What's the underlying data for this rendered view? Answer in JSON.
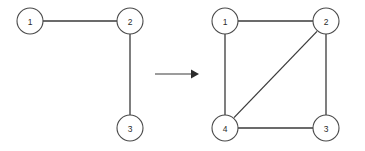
{
  "figure": {
    "background_color": "#ffffff",
    "width": 365,
    "height": 151
  },
  "style": {
    "node_fill": "#ffffff",
    "node_stroke": "#4a4a4a",
    "edge_stroke": "#3a3a3a",
    "label_color": "#2b2b2b",
    "node_radius": 13,
    "edge_width": 1.3
  },
  "left_graph": {
    "name": "before-graph",
    "nodes": [
      {
        "id": "1",
        "label": "1",
        "cx": 30,
        "cy": 21
      },
      {
        "id": "2",
        "label": "2",
        "cx": 130,
        "cy": 21
      },
      {
        "id": "3",
        "label": "3",
        "cx": 130,
        "cy": 128
      }
    ],
    "edges": [
      {
        "from": "1",
        "to": "2",
        "x1": 43,
        "y1": 21,
        "x2": 117,
        "y2": 21
      },
      {
        "from": "2",
        "to": "3",
        "x1": 130,
        "y1": 34,
        "x2": 130,
        "y2": 115
      }
    ]
  },
  "arrow": {
    "name": "transformation-arrow",
    "x1": 155,
    "y1": 74,
    "x2": 191,
    "y2": 74,
    "head_points": "191,69.5 199,74 191,78.5"
  },
  "right_graph": {
    "name": "after-graph",
    "nodes": [
      {
        "id": "1",
        "label": "1",
        "cx": 225,
        "cy": 21
      },
      {
        "id": "2",
        "label": "2",
        "cx": 326,
        "cy": 21
      },
      {
        "id": "4",
        "label": "4",
        "cx": 225,
        "cy": 128
      },
      {
        "id": "3",
        "label": "3",
        "cx": 326,
        "cy": 128
      }
    ],
    "edges": [
      {
        "from": "1",
        "to": "2",
        "x1": 238,
        "y1": 21,
        "x2": 313,
        "y2": 21
      },
      {
        "from": "1",
        "to": "4",
        "x1": 225,
        "y1": 34,
        "x2": 225,
        "y2": 115
      },
      {
        "from": "2",
        "to": "3",
        "x1": 326,
        "y1": 34,
        "x2": 326,
        "y2": 115
      },
      {
        "from": "4",
        "to": "3",
        "x1": 238,
        "y1": 128,
        "x2": 313,
        "y2": 128
      },
      {
        "from": "2",
        "to": "4",
        "x1": 317.0,
        "y1": 31.4,
        "x2": 234.0,
        "y2": 117.6
      }
    ]
  }
}
